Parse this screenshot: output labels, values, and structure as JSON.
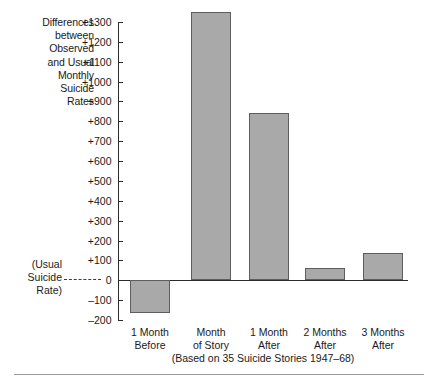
{
  "figure": {
    "side_title_lines": [
      "Differences",
      "between",
      "Observed",
      "and Usual",
      "Monthly",
      "Suicide",
      "Rates"
    ],
    "baseline_annotation_lines": [
      "(Usual",
      "Suicide",
      "Rate)"
    ],
    "source_note": "(Based on 35 Suicide Stories 1947–68)",
    "bar_fill_color": "#a9a9a9",
    "bar_border_color": "#5e5e5e",
    "axis_color": "#2b2b2b",
    "text_color": "#1a1a1a"
  },
  "chart_data": {
    "type": "bar",
    "title": "Differences between Observed and Usual Monthly Suicide Rates",
    "subtitle": "(Based on 35 Suicide Stories 1947–68)",
    "xlabel": "",
    "ylabel": "Differences between Observed and Usual Monthly Suicide Rates",
    "categories": [
      "1 Month Before",
      "Month of Story",
      "1 Month After",
      "2 Months After",
      "3 Months After"
    ],
    "category_lines": [
      [
        "1 Month",
        "Before"
      ],
      [
        "Month",
        "of Story"
      ],
      [
        "1 Month",
        "After"
      ],
      [
        "2 Months",
        "After"
      ],
      [
        "3 Months",
        "After"
      ]
    ],
    "values": [
      -165,
      1350,
      840,
      60,
      135
    ],
    "ylim": [
      -200,
      1300
    ],
    "ytick_values": [
      1300,
      1200,
      1100,
      1000,
      900,
      800,
      700,
      600,
      500,
      400,
      300,
      200,
      100,
      0,
      -100,
      -200
    ],
    "ytick_labels": [
      "+1300",
      "+1200",
      "+1100",
      "+1000",
      "+900",
      "+800",
      "+700",
      "+600",
      "+500",
      "+400",
      "+300",
      "+200",
      "+100",
      "0",
      "–100",
      "–200"
    ],
    "grid": false,
    "legend": null,
    "baseline_value": 0,
    "baseline_label": "(Usual Suicide Rate)"
  }
}
